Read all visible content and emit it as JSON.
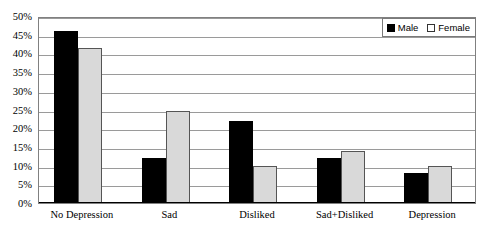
{
  "chart_data": {
    "type": "bar",
    "title": "",
    "subtitle": "",
    "xlabel": "",
    "ylabel": "",
    "categories": [
      "No Depression",
      "Sad",
      "Disliked",
      "Sad+Disliked",
      "Depression"
    ],
    "series": [
      {
        "name": "Male",
        "color": "#000000",
        "values": [
          46,
          12,
          22,
          12,
          8
        ]
      },
      {
        "name": "Female",
        "color": "#D9D9D9",
        "values": [
          41.5,
          24.5,
          10,
          14,
          10
        ]
      }
    ],
    "ylim": [
      0,
      50
    ],
    "ytick_step": 5,
    "ytick_labels": [
      "50%",
      "45%",
      "40%",
      "35%",
      "30%",
      "25%",
      "20%",
      "15%",
      "10%",
      "5%",
      "0%"
    ],
    "ytick_values": [
      50,
      45,
      40,
      35,
      30,
      25,
      20,
      15,
      10,
      5,
      0
    ],
    "grid": "horizontal",
    "legend_position": "top-right",
    "value_suffix": "%"
  },
  "legend": {
    "entries": [
      {
        "label": "Male"
      },
      {
        "label": "Female"
      }
    ]
  },
  "colors": {
    "male_bar": "#000000",
    "female_bar": "#D9D9D9",
    "female_bar_border": "#555555",
    "gridline": "#9A9A9A",
    "plot_border": "#808080",
    "axis": "#000000",
    "background": "#FFFFFF",
    "text": "#000000"
  }
}
